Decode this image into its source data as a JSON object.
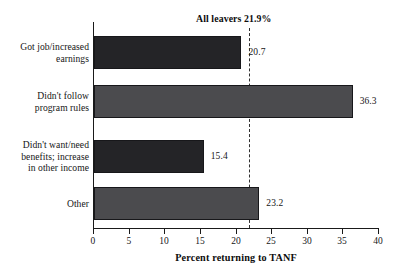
{
  "chart_data": {
    "type": "bar",
    "orientation": "horizontal",
    "title": "",
    "xlabel": "Percent returning to TANF",
    "ylabel": "",
    "xlim": [
      0,
      40
    ],
    "xticks": [
      0,
      5,
      10,
      15,
      20,
      25,
      30,
      35,
      40
    ],
    "xtick_labels": [
      "0",
      "5",
      "10",
      "15",
      "20",
      "25",
      "30",
      "35",
      "40"
    ],
    "grid": false,
    "legend": null,
    "categories": [
      "Got job/increased earnings",
      "Didn't follow program rules",
      "Didn't want/need benefits; increase in other income",
      "Other"
    ],
    "values": [
      20.7,
      36.3,
      15.4,
      23.2
    ],
    "value_labels": [
      "20.7",
      "36.3",
      "15.4",
      "23.2"
    ],
    "bar_colors": [
      "#242427",
      "#4b4b4e",
      "#242427",
      "#4b4b4e"
    ],
    "annotations": [
      {
        "text": "All leavers 21.9%",
        "value": 21.9,
        "type": "reference-line",
        "style": "dashed"
      }
    ]
  },
  "labels": {
    "category_lines": [
      [
        "Got job/increased",
        "earnings"
      ],
      [
        "Didn't follow",
        "program rules"
      ],
      [
        "Didn't want/need",
        "benefits; increase",
        "in other income"
      ],
      [
        "Other"
      ]
    ]
  }
}
